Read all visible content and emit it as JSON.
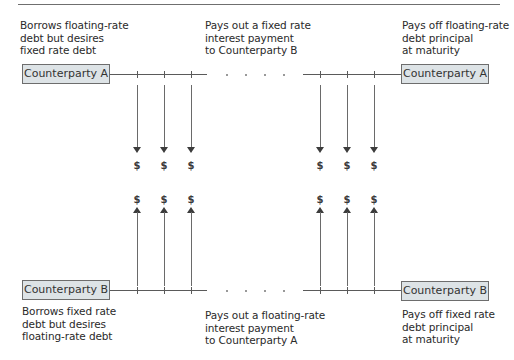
{
  "diagram": {
    "type": "interest-rate-swap-cash-flow",
    "top": {
      "counterparty_left": "Counterparty A",
      "counterparty_right": "Counterparty A",
      "desc_left": "Borrows floating-rate\ndebt but desires\nfixed rate debt",
      "desc_middle": "Pays out a fixed rate\ninterest payment\nto Counterparty B",
      "desc_right": "Pays off floating-rate\ndebt principal\nat maturity"
    },
    "bottom": {
      "counterparty_left": "Counterparty B",
      "counterparty_right": "Counterparty B",
      "desc_left": "Borrows fixed rate\ndebt but desires\nfloating-rate debt",
      "desc_middle": "Pays out a floating-rate\ninterest payment\nto Counterparty A",
      "desc_right": "Pays off fixed rate\ndebt principal\nat maturity"
    },
    "cash_symbol": "$",
    "flows": {
      "top_down_count": 6,
      "bottom_up_count": 6
    },
    "colors": {
      "box_fill": "#dde3e6",
      "box_border": "#6d6d6d",
      "line": "#5a5a5a",
      "arrow": "#3c3c3c"
    }
  }
}
